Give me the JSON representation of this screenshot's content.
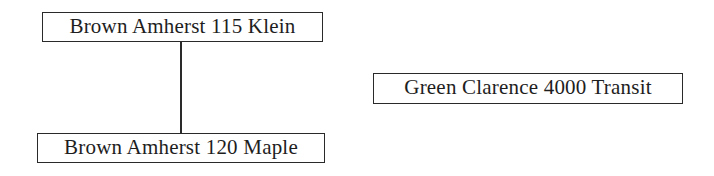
{
  "diagram": {
    "type": "tree",
    "nodes": [
      {
        "id": "a",
        "label": "Brown Amherst 115 Klein"
      },
      {
        "id": "b",
        "label": "Brown Amherst 120 Maple"
      },
      {
        "id": "c",
        "label": "Green Clarence 4000 Transit"
      }
    ],
    "edges": [
      {
        "from": "a",
        "to": "b"
      }
    ]
  }
}
